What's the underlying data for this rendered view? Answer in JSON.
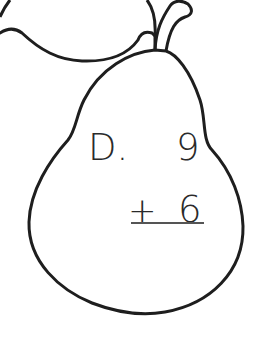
{
  "worksheet": {
    "problem_label": "D.",
    "addend_top": "9",
    "operator": "+",
    "addend_bottom": "6",
    "shape": "pear",
    "colors": {
      "outline": "#1e1e1e",
      "text": "#2a2a2a",
      "background": "#ffffff"
    }
  }
}
